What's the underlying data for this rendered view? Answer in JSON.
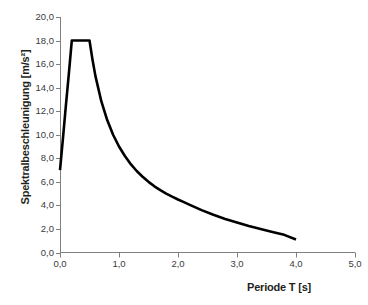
{
  "chart_data": {
    "type": "line",
    "title": "",
    "xlabel": "Periode T [s]",
    "ylabel": "Spektralbeschleunigung [m/s²]",
    "xlim": [
      0.0,
      5.0
    ],
    "ylim": [
      0.0,
      20.0
    ],
    "xticks": [
      "0,0",
      "1,0",
      "2,0",
      "3,0",
      "4,0",
      "5,0"
    ],
    "xtick_values": [
      0.0,
      1.0,
      2.0,
      3.0,
      4.0,
      5.0
    ],
    "yticks": [
      "0,0",
      "2,0",
      "4,0",
      "6,0",
      "8,0",
      "10,0",
      "12,0",
      "14,0",
      "16,0",
      "18,0",
      "20,0"
    ],
    "ytick_values": [
      0.0,
      2.0,
      4.0,
      6.0,
      8.0,
      10.0,
      12.0,
      14.0,
      16.0,
      18.0,
      20.0
    ],
    "grid": false,
    "legend": false,
    "legend_position": "none",
    "line_color": "#000000",
    "axis_color": "#808080",
    "background_color": "#ffffff",
    "series": [
      {
        "name": "Bemessungsspektrum",
        "x": [
          0.0,
          0.05,
          0.1,
          0.15,
          0.2,
          0.3,
          0.4,
          0.5,
          0.55,
          0.6,
          0.7,
          0.8,
          0.9,
          1.0,
          1.1,
          1.2,
          1.3,
          1.4,
          1.5,
          1.6,
          1.7,
          1.8,
          1.9,
          2.0,
          2.1,
          2.2,
          2.4,
          2.6,
          2.8,
          3.0,
          3.2,
          3.4,
          3.6,
          3.8,
          4.0
        ],
        "y": [
          7.0,
          9.7,
          12.5,
          15.2,
          18.0,
          18.0,
          18.0,
          18.0,
          16.4,
          15.0,
          12.85,
          11.25,
          10.0,
          9.0,
          8.2,
          7.5,
          6.92,
          6.43,
          6.0,
          5.62,
          5.29,
          5.0,
          4.74,
          4.5,
          4.28,
          4.05,
          3.6,
          3.2,
          2.85,
          2.55,
          2.25,
          2.0,
          1.75,
          1.5,
          1.1
        ]
      }
    ],
    "annotations": []
  },
  "axes": {
    "y_title": "Spektralbeschleunigung [m/s²]",
    "x_title": "Periode T [s]"
  },
  "y_tick_labels": [
    "20,0",
    "18,0",
    "16,0",
    "14,0",
    "12,0",
    "10,0",
    "8,0",
    "6,0",
    "4,0",
    "2,0",
    "0,0"
  ],
  "x_tick_labels": [
    "0,0",
    "1,0",
    "2,0",
    "3,0",
    "4,0",
    "5,0"
  ]
}
